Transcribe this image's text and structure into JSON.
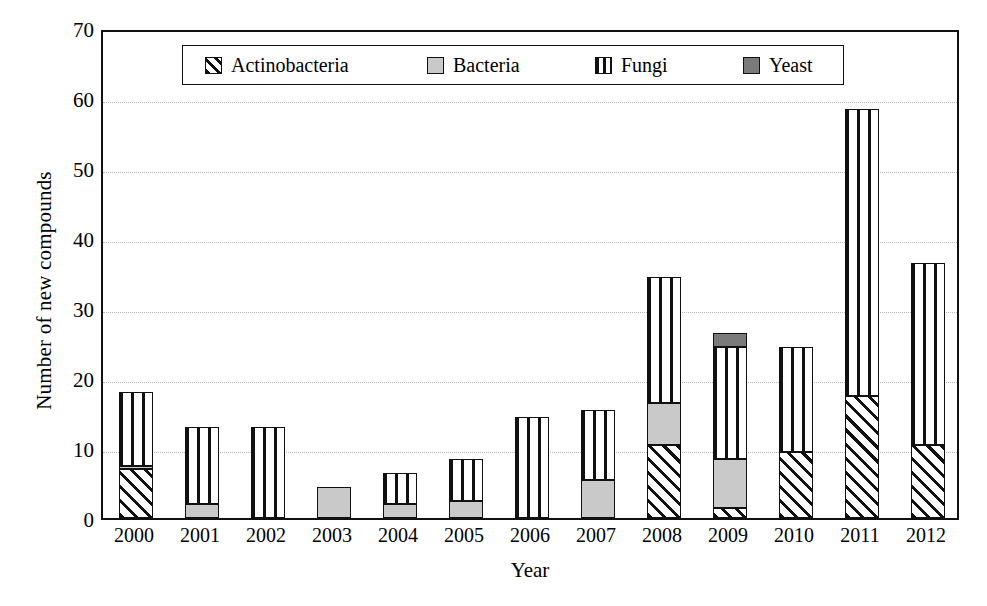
{
  "chart_data": {
    "type": "bar",
    "stacked": true,
    "title": "",
    "xlabel": "Year",
    "ylabel": "Number of new compounds",
    "ylim": [
      0,
      70
    ],
    "ytick_step": 10,
    "yticks": [
      0,
      10,
      20,
      30,
      40,
      50,
      60,
      70
    ],
    "grid": true,
    "grid_axis": "y",
    "legend_position": "top-inside",
    "categories": [
      "2000",
      "2001",
      "2002",
      "2003",
      "2004",
      "2005",
      "2006",
      "2007",
      "2008",
      "2009",
      "2010",
      "2011",
      "2012"
    ],
    "series": [
      {
        "name": "Actinobacteria",
        "pattern": "diagonal-hatch",
        "color": "#111111",
        "values": [
          7,
          0,
          0,
          0,
          0,
          0,
          0,
          0,
          10.5,
          1.5,
          9.5,
          17.5,
          10.5
        ]
      },
      {
        "name": "Bacteria",
        "pattern": "solid-light-gray",
        "color": "#c9c9c9",
        "values": [
          0.5,
          2,
          0,
          4.5,
          2,
          2.5,
          0,
          5.5,
          6,
          7,
          0,
          0,
          0
        ]
      },
      {
        "name": "Fungi",
        "pattern": "vertical-stripes",
        "color": "#111111",
        "values": [
          10.5,
          11,
          13,
          0,
          4.5,
          6,
          14.5,
          10,
          18,
          16,
          15,
          41,
          26
        ]
      },
      {
        "name": "Yeast",
        "pattern": "solid-dark-gray",
        "color": "#7a7a7a",
        "values": [
          0,
          0,
          0,
          0,
          0,
          0,
          0,
          0,
          0,
          2,
          0,
          0,
          0
        ]
      }
    ],
    "totals": [
      18,
      13,
      13,
      4.5,
      6.5,
      8.5,
      14.5,
      15.5,
      34.5,
      26.5,
      24.5,
      58.5,
      36.5
    ]
  },
  "legend": {
    "items": [
      {
        "label": "Actinobacteria",
        "swatch": "actino"
      },
      {
        "label": "Bacteria",
        "swatch": "bact"
      },
      {
        "label": "Fungi",
        "swatch": "fungi"
      },
      {
        "label": "Yeast",
        "swatch": "yeast"
      }
    ]
  }
}
